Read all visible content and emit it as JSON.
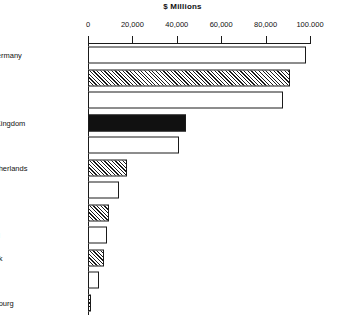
{
  "chart_data": {
    "type": "bar",
    "orientation": "horizontal",
    "title": "$ Millions",
    "xlabel": "",
    "ylabel": "",
    "xlim": [
      0,
      100000
    ],
    "grid": false,
    "legend": null,
    "xticks": [
      0,
      20000,
      40000,
      60000,
      80000,
      100000
    ],
    "xtick_labels": [
      "0",
      "20,000",
      "40,000",
      "60,000",
      "80,000",
      "100.000"
    ],
    "categories": [
      "West Germany",
      "France",
      "Italy",
      "United Kingdom",
      "Spain",
      "The Netherlands",
      "Belgium",
      "Greece",
      "Portugal",
      "Denmark",
      "Ireland",
      "Luxembourg"
    ],
    "values": [
      98000,
      91000,
      88000,
      44000,
      41000,
      17500,
      14000,
      9500,
      8500,
      7000,
      5000,
      1000
    ],
    "fills": [
      "white",
      "hatch",
      "white",
      "black",
      "white",
      "hatch",
      "white",
      "hatch",
      "white",
      "hatch",
      "white",
      "hatch"
    ]
  },
  "colors": {
    "line": "#1a1a1a",
    "background": "#ffffff",
    "bar_solid": "#111111",
    "bar_empty": "#ffffff"
  }
}
